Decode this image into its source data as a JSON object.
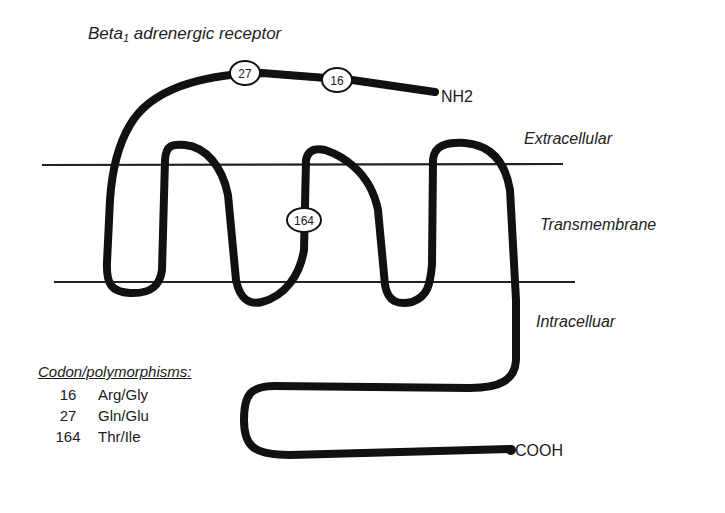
{
  "title": {
    "main": "Beta",
    "subscript": "1",
    "rest": " adrenergic receptor"
  },
  "regions": {
    "extracellular": "Extracellular",
    "transmembrane": "Transmembrane",
    "intracellular": "Intracelluar"
  },
  "terminals": {
    "n_terminus": "NH2",
    "c_terminus": "COOH"
  },
  "markers": [
    {
      "label": "27"
    },
    {
      "label": "16"
    },
    {
      "label": "164"
    }
  ],
  "legend": {
    "heading": "Codon/polymorphisms:",
    "rows": [
      {
        "codon": "16",
        "polymorphism": "Arg/Gly"
      },
      {
        "codon": "27",
        "polymorphism": "Gln/Glu"
      },
      {
        "codon": "164",
        "polymorphism": "Thr/Ile"
      }
    ]
  },
  "colors": {
    "strand": "#111111",
    "membrane": "#222222",
    "background": "#ffffff"
  }
}
